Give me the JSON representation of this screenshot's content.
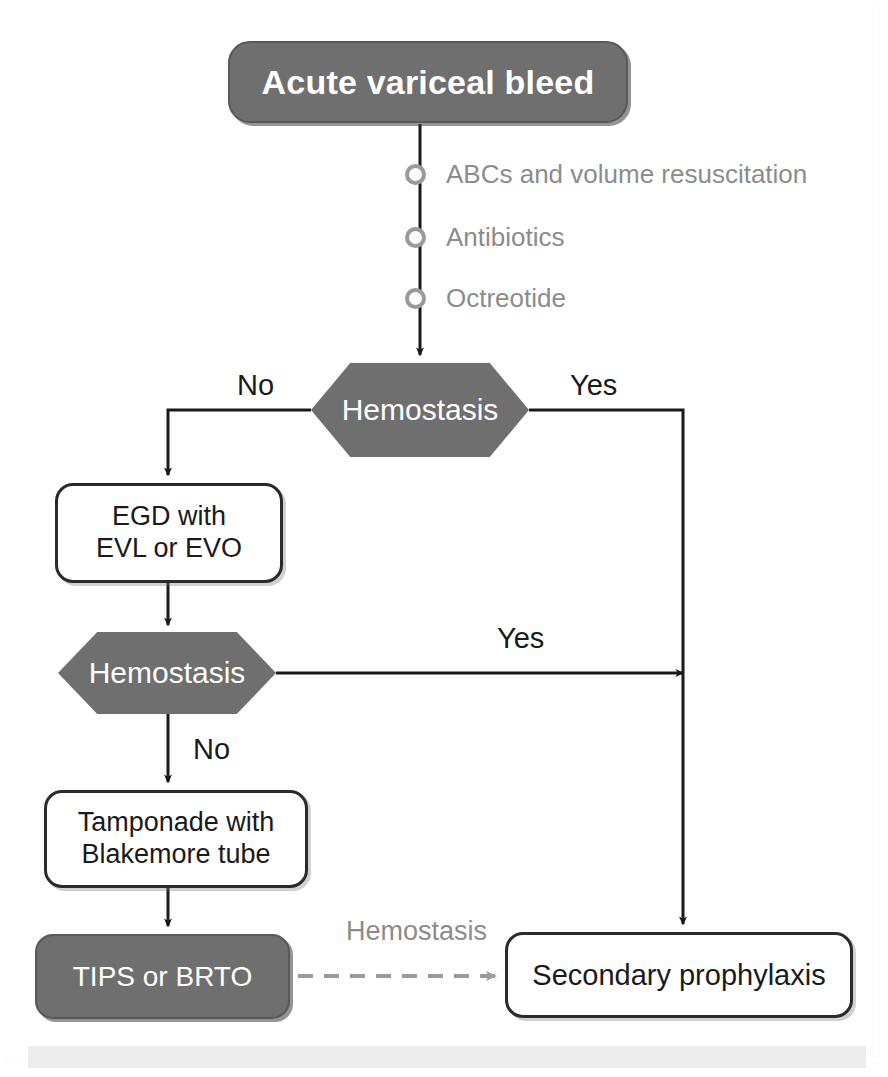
{
  "diagram": {
    "colors": {
      "node_dark_fill": "#6f6f6f",
      "node_dark_text": "#ffffff",
      "node_white_fill": "#ffffff",
      "node_white_text": "#1a1a1a",
      "line": "#1a1a1a",
      "muted_text": "#8c8c8c",
      "bottom_band": "#ececec"
    },
    "nodes": {
      "acute": {
        "label": "Acute variceal bleed",
        "shape": "rounded-rect",
        "style": "dark"
      },
      "hemostasis_1": {
        "label": "Hemostasis",
        "shape": "hexagon",
        "style": "dark"
      },
      "egd": {
        "line1": "EGD with",
        "line2": "EVL or EVO",
        "shape": "rounded-rect",
        "style": "white"
      },
      "hemostasis_2": {
        "label": "Hemostasis",
        "shape": "hexagon",
        "style": "dark"
      },
      "tamponade": {
        "line1": "Tamponade with",
        "line2": "Blakemore tube",
        "shape": "rounded-rect",
        "style": "white"
      },
      "tips": {
        "label": "TIPS or BRTO",
        "shape": "rounded-rect",
        "style": "dark"
      },
      "secondary": {
        "label": "Secondary prophylaxis",
        "shape": "rounded-rect",
        "style": "white"
      }
    },
    "bullets": [
      {
        "text": "ABCs and volume resuscitation"
      },
      {
        "text": "Antibiotics"
      },
      {
        "text": "Octreotide"
      }
    ],
    "edge_labels": {
      "no_1": "No",
      "yes_1": "Yes",
      "yes_2": "Yes",
      "no_2": "No",
      "hemostasis_dashed": "Hemostasis"
    }
  }
}
